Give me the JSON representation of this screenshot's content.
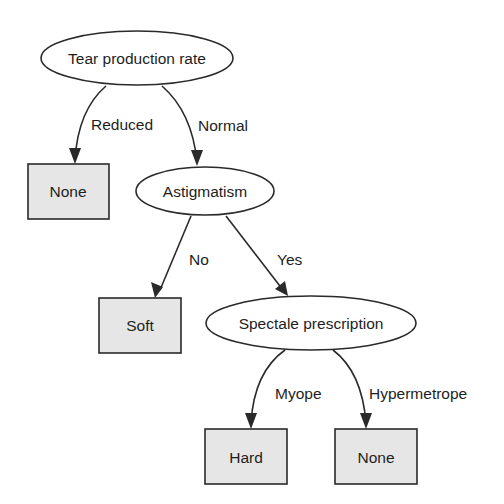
{
  "diagram": {
    "type": "decision-tree",
    "nodes": {
      "root": {
        "label": "Tear production rate",
        "shape": "ellipse"
      },
      "leaf_none_1": {
        "label": "None",
        "shape": "box"
      },
      "astigmatism": {
        "label": "Astigmatism",
        "shape": "ellipse"
      },
      "leaf_soft": {
        "label": "Soft",
        "shape": "box"
      },
      "spectacle": {
        "label": "Spectale prescription",
        "shape": "ellipse"
      },
      "leaf_hard": {
        "label": "Hard",
        "shape": "box"
      },
      "leaf_none_2": {
        "label": "None",
        "shape": "box"
      }
    },
    "edges": {
      "reduced": {
        "label": "Reduced",
        "from": "root",
        "to": "leaf_none_1"
      },
      "normal": {
        "label": "Normal",
        "from": "root",
        "to": "astigmatism"
      },
      "no": {
        "label": "No",
        "from": "astigmatism",
        "to": "leaf_soft"
      },
      "yes": {
        "label": "Yes",
        "from": "astigmatism",
        "to": "spectacle"
      },
      "myope": {
        "label": "Myope",
        "from": "spectacle",
        "to": "leaf_hard"
      },
      "hypermetrope": {
        "label": "Hypermetrope",
        "from": "spectacle",
        "to": "leaf_none_2"
      }
    },
    "colors": {
      "stroke": "#2a2a2a",
      "leaf_fill": "#e6e6e6",
      "text": "#1e1e1e"
    }
  }
}
